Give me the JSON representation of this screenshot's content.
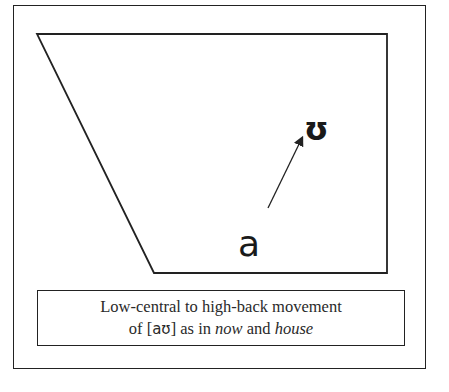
{
  "diagram": {
    "vowel_start": "a",
    "vowel_end": "ʊ",
    "arrow": {
      "from": [
        268,
        208
      ],
      "to": [
        303,
        136
      ]
    },
    "quadrilateral": {
      "points": [
        [
          37,
          34
        ],
        [
          387,
          34
        ],
        [
          387,
          273
        ],
        [
          154,
          273
        ]
      ]
    }
  },
  "caption": {
    "line1": "Low-central to high-back movement",
    "line2_prefix": "of [",
    "line2_ipa": "aʊ",
    "line2_middle": "] as in ",
    "example1": "now",
    "line2_and": " and ",
    "example2": "house"
  },
  "colors": {
    "stroke": "#222222",
    "text": "#2a2a2a",
    "background": "#ffffff"
  }
}
